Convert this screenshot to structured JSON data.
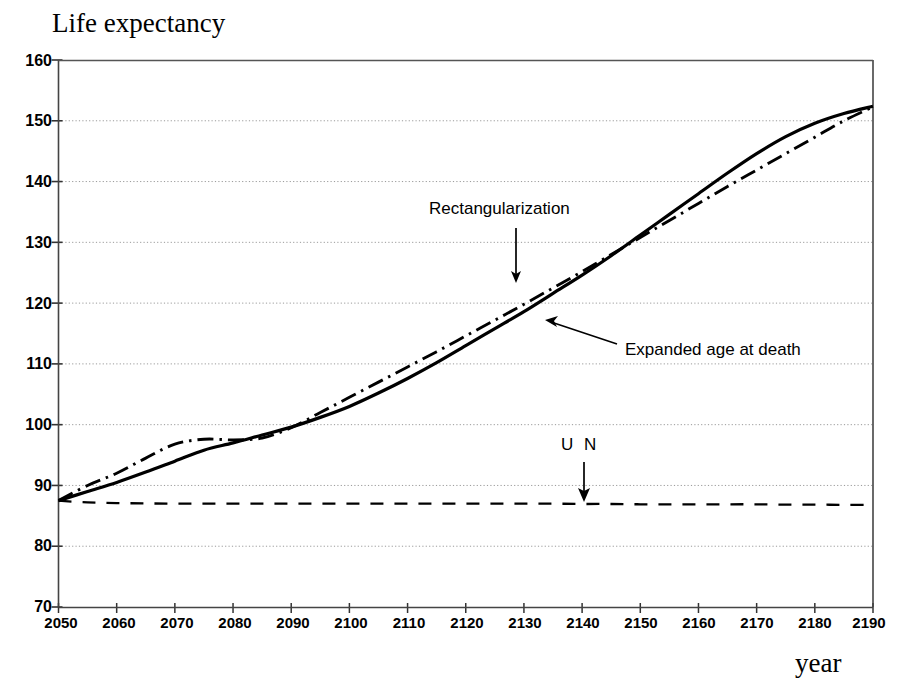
{
  "chart_data": {
    "type": "line",
    "title": "Life expectancy",
    "xlabel": "year",
    "ylabel": "",
    "xlim": [
      2050,
      2190
    ],
    "ylim": [
      70,
      160
    ],
    "grid": true,
    "legend_position": "inline-annotations",
    "xticks": [
      "2050",
      "2060",
      "2070",
      "2080",
      "2090",
      "2100",
      "2110",
      "2120",
      "2130",
      "2140",
      "2150",
      "2160",
      "2170",
      "2180",
      "2190"
    ],
    "yticks": [
      "70",
      "80",
      "90",
      "100",
      "110",
      "120",
      "130",
      "140",
      "150",
      "160"
    ],
    "x": [
      2050,
      2055,
      2060,
      2065,
      2070,
      2075,
      2080,
      2085,
      2090,
      2095,
      2100,
      2105,
      2110,
      2115,
      2120,
      2125,
      2130,
      2135,
      2140,
      2145,
      2150,
      2155,
      2160,
      2165,
      2170,
      2175,
      2180,
      2185,
      2190
    ],
    "series": [
      {
        "name": "Rectangularization",
        "style": "dash-dot",
        "values": [
          87.5,
          90.0,
          92.0,
          94.5,
          96.8,
          97.6,
          97.5,
          97.8,
          99.5,
          102.0,
          104.5,
          107.0,
          109.5,
          112.0,
          114.6,
          117.2,
          119.8,
          122.5,
          125.2,
          128.0,
          130.8,
          133.6,
          136.4,
          139.2,
          141.9,
          144.6,
          147.3,
          150.0,
          152.3
        ]
      },
      {
        "name": "Expanded age at death",
        "style": "solid",
        "values": [
          87.5,
          89.0,
          90.5,
          92.2,
          94.0,
          95.8,
          97.0,
          98.3,
          99.6,
          101.2,
          103.0,
          105.2,
          107.6,
          110.2,
          113.0,
          115.8,
          118.6,
          121.6,
          124.6,
          127.8,
          131.2,
          134.6,
          138.0,
          141.4,
          144.6,
          147.4,
          149.6,
          151.2,
          152.4
        ]
      },
      {
        "name": "UN",
        "style": "dashed",
        "values": [
          87.5,
          87.2,
          87.1,
          87.05,
          87.0,
          87.0,
          87.0,
          87.0,
          87.0,
          87.0,
          87.0,
          87.0,
          87.0,
          87.0,
          87.0,
          87.0,
          87.0,
          87.0,
          86.95,
          86.95,
          86.9,
          86.9,
          86.9,
          86.9,
          86.9,
          86.85,
          86.85,
          86.8,
          86.8
        ]
      }
    ],
    "annotations": [
      {
        "text": "Rectangularization",
        "target_series": "Rectangularization",
        "arrow": "down"
      },
      {
        "text": "Expanded age at death",
        "target_series": "Expanded age at death",
        "arrow": "up-left"
      },
      {
        "text": "U N",
        "target_series": "UN",
        "arrow": "down"
      }
    ]
  },
  "colors": {
    "line": "#000000",
    "grid": "#9a9a9a",
    "axis": "#555555",
    "background": "#ffffff"
  }
}
